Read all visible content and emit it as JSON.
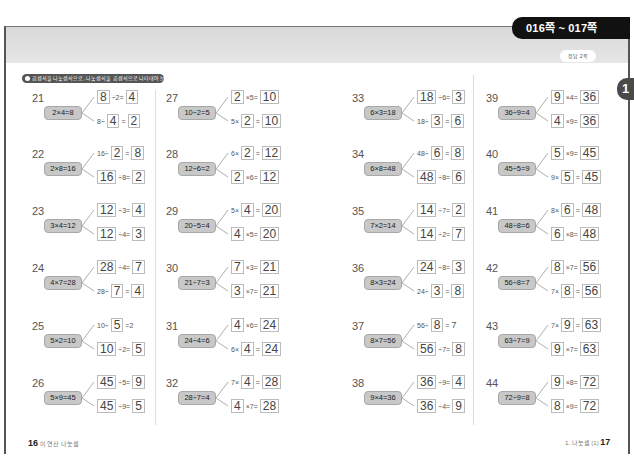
{
  "header": {
    "page_range": "016쪽 ~ 017쪽",
    "answer_label": "정답 2쪽",
    "chapter_badge": "1"
  },
  "instruction": "곱셈식을 나눗셈식으로, 나눗셈식을 곱셈식으로 나타내어 보세요.",
  "problems": [
    {
      "num": "21",
      "given": "2×4=8",
      "top": [
        [
          "box",
          "8"
        ],
        [
          "txt",
          "÷2="
        ],
        [
          "box",
          "4"
        ]
      ],
      "bottom": [
        [
          "txt",
          "8÷"
        ],
        [
          "box",
          "4"
        ],
        [
          "txt",
          "="
        ],
        [
          "box",
          "2"
        ]
      ]
    },
    {
      "num": "22",
      "given": "2×8=16",
      "top": [
        [
          "txt",
          "16÷"
        ],
        [
          "box",
          "2"
        ],
        [
          "txt",
          "="
        ],
        [
          "box",
          "8"
        ]
      ],
      "bottom": [
        [
          "box",
          "16"
        ],
        [
          "txt",
          "÷8="
        ],
        [
          "box",
          "2"
        ]
      ]
    },
    {
      "num": "23",
      "given": "3×4=12",
      "top": [
        [
          "box",
          "12"
        ],
        [
          "txt",
          "÷3="
        ],
        [
          "box",
          "4"
        ]
      ],
      "bottom": [
        [
          "box",
          "12"
        ],
        [
          "txt",
          "÷4="
        ],
        [
          "box",
          "3"
        ]
      ]
    },
    {
      "num": "24",
      "given": "4×7=28",
      "top": [
        [
          "box",
          "28"
        ],
        [
          "txt",
          "÷4="
        ],
        [
          "box",
          "7"
        ]
      ],
      "bottom": [
        [
          "txt",
          "28÷"
        ],
        [
          "box",
          "7"
        ],
        [
          "txt",
          "="
        ],
        [
          "box",
          "4"
        ]
      ]
    },
    {
      "num": "25",
      "given": "5×2=10",
      "top": [
        [
          "txt",
          "10÷"
        ],
        [
          "box",
          "5"
        ],
        [
          "txt",
          "=2"
        ]
      ],
      "bottom": [
        [
          "box",
          "10"
        ],
        [
          "txt",
          "÷2="
        ],
        [
          "box",
          "5"
        ]
      ]
    },
    {
      "num": "26",
      "given": "5×9=45",
      "top": [
        [
          "box",
          "45"
        ],
        [
          "txt",
          "÷5="
        ],
        [
          "box",
          "9"
        ]
      ],
      "bottom": [
        [
          "box",
          "45"
        ],
        [
          "txt",
          "÷9="
        ],
        [
          "box",
          "5"
        ]
      ]
    },
    {
      "num": "27",
      "given": "10÷2=5",
      "top": [
        [
          "box",
          "2"
        ],
        [
          "txt",
          "×5="
        ],
        [
          "box",
          "10"
        ]
      ],
      "bottom": [
        [
          "txt",
          "5×"
        ],
        [
          "box",
          "2"
        ],
        [
          "txt",
          "="
        ],
        [
          "box",
          "10"
        ]
      ]
    },
    {
      "num": "28",
      "given": "12÷6=2",
      "top": [
        [
          "txt",
          "6×"
        ],
        [
          "box",
          "2"
        ],
        [
          "txt",
          "="
        ],
        [
          "box",
          "12"
        ]
      ],
      "bottom": [
        [
          "box",
          "2"
        ],
        [
          "txt",
          "×6="
        ],
        [
          "box",
          "12"
        ]
      ]
    },
    {
      "num": "29",
      "given": "20÷5=4",
      "top": [
        [
          "txt",
          "5×"
        ],
        [
          "box",
          "4"
        ],
        [
          "txt",
          "="
        ],
        [
          "box",
          "20"
        ]
      ],
      "bottom": [
        [
          "box",
          "4"
        ],
        [
          "txt",
          "×5="
        ],
        [
          "box",
          "20"
        ]
      ]
    },
    {
      "num": "30",
      "given": "21÷7=3",
      "top": [
        [
          "box",
          "7"
        ],
        [
          "txt",
          "×3="
        ],
        [
          "box",
          "21"
        ]
      ],
      "bottom": [
        [
          "box",
          "3"
        ],
        [
          "txt",
          "×7="
        ],
        [
          "box",
          "21"
        ]
      ]
    },
    {
      "num": "31",
      "given": "24÷4=6",
      "top": [
        [
          "box",
          "4"
        ],
        [
          "txt",
          "×6="
        ],
        [
          "box",
          "24"
        ]
      ],
      "bottom": [
        [
          "txt",
          "6×"
        ],
        [
          "box",
          "4"
        ],
        [
          "txt",
          "="
        ],
        [
          "box",
          "24"
        ]
      ]
    },
    {
      "num": "32",
      "given": "28÷7=4",
      "top": [
        [
          "txt",
          "7×"
        ],
        [
          "box",
          "4"
        ],
        [
          "txt",
          "="
        ],
        [
          "box",
          "28"
        ]
      ],
      "bottom": [
        [
          "box",
          "4"
        ],
        [
          "txt",
          "×7="
        ],
        [
          "box",
          "28"
        ]
      ]
    },
    {
      "num": "33",
      "given": "6×3=18",
      "top": [
        [
          "box",
          "18"
        ],
        [
          "txt",
          "÷6="
        ],
        [
          "box",
          "3"
        ]
      ],
      "bottom": [
        [
          "txt",
          "18÷"
        ],
        [
          "box",
          "3"
        ],
        [
          "txt",
          "="
        ],
        [
          "box",
          "6"
        ]
      ]
    },
    {
      "num": "34",
      "given": "6×8=48",
      "top": [
        [
          "txt",
          "48÷"
        ],
        [
          "box",
          "6"
        ],
        [
          "txt",
          "="
        ],
        [
          "box",
          "8"
        ]
      ],
      "bottom": [
        [
          "box",
          "48"
        ],
        [
          "txt",
          "÷8="
        ],
        [
          "box",
          "6"
        ]
      ]
    },
    {
      "num": "35",
      "given": "7×2=14",
      "top": [
        [
          "box",
          "14"
        ],
        [
          "txt",
          "÷7="
        ],
        [
          "box",
          "2"
        ]
      ],
      "bottom": [
        [
          "box",
          "14"
        ],
        [
          "txt",
          "÷2="
        ],
        [
          "box",
          "7"
        ]
      ]
    },
    {
      "num": "36",
      "given": "8×3=24",
      "top": [
        [
          "box",
          "24"
        ],
        [
          "txt",
          "÷8="
        ],
        [
          "box",
          "3"
        ]
      ],
      "bottom": [
        [
          "txt",
          "24÷"
        ],
        [
          "box",
          "3"
        ],
        [
          "txt",
          "="
        ],
        [
          "box",
          "8"
        ]
      ]
    },
    {
      "num": "37",
      "given": "8×7=56",
      "top": [
        [
          "txt",
          "56÷"
        ],
        [
          "box",
          "8"
        ],
        [
          "txt",
          "="
        ],
        [
          "bigtxt",
          "7"
        ]
      ],
      "bottom": [
        [
          "box",
          "56"
        ],
        [
          "txt",
          "÷7="
        ],
        [
          "box",
          "8"
        ]
      ]
    },
    {
      "num": "38",
      "given": "9×4=36",
      "top": [
        [
          "box",
          "36"
        ],
        [
          "txt",
          "÷9="
        ],
        [
          "box",
          "4"
        ]
      ],
      "bottom": [
        [
          "box",
          "36"
        ],
        [
          "txt",
          "÷4="
        ],
        [
          "box",
          "9"
        ]
      ]
    },
    {
      "num": "39",
      "given": "36÷9=4",
      "top": [
        [
          "box",
          "9"
        ],
        [
          "txt",
          "×4="
        ],
        [
          "box",
          "36"
        ]
      ],
      "bottom": [
        [
          "box",
          "4"
        ],
        [
          "txt",
          "×9="
        ],
        [
          "box",
          "36"
        ]
      ]
    },
    {
      "num": "40",
      "given": "45÷5=9",
      "top": [
        [
          "box",
          "5"
        ],
        [
          "txt",
          "×9="
        ],
        [
          "box",
          "45"
        ]
      ],
      "bottom": [
        [
          "txt",
          "9×"
        ],
        [
          "box",
          "5"
        ],
        [
          "txt",
          "="
        ],
        [
          "box",
          "45"
        ]
      ]
    },
    {
      "num": "41",
      "given": "48÷8=6",
      "top": [
        [
          "txt",
          "8×"
        ],
        [
          "box",
          "6"
        ],
        [
          "txt",
          "="
        ],
        [
          "box",
          "48"
        ]
      ],
      "bottom": [
        [
          "box",
          "6"
        ],
        [
          "txt",
          "×8="
        ],
        [
          "box",
          "48"
        ]
      ]
    },
    {
      "num": "42",
      "given": "56÷8=7",
      "top": [
        [
          "box",
          "8"
        ],
        [
          "txt",
          "×7="
        ],
        [
          "box",
          "56"
        ]
      ],
      "bottom": [
        [
          "txt",
          "7×"
        ],
        [
          "box",
          "8"
        ],
        [
          "txt",
          "="
        ],
        [
          "box",
          "56"
        ]
      ]
    },
    {
      "num": "43",
      "given": "63÷7=9",
      "top": [
        [
          "txt",
          "7×"
        ],
        [
          "box",
          "9"
        ],
        [
          "txt",
          "="
        ],
        [
          "box",
          "63"
        ]
      ],
      "bottom": [
        [
          "box",
          "9"
        ],
        [
          "txt",
          "×7="
        ],
        [
          "box",
          "63"
        ]
      ]
    },
    {
      "num": "44",
      "given": "72÷9=8",
      "top": [
        [
          "box",
          "9"
        ],
        [
          "txt",
          "×8="
        ],
        [
          "box",
          "72"
        ]
      ],
      "bottom": [
        [
          "box",
          "8"
        ],
        [
          "txt",
          "×9="
        ],
        [
          "box",
          "72"
        ]
      ]
    }
  ],
  "footer": {
    "left_page": "16",
    "left_title": "이 연산 나눗셈",
    "right_title": "1. 나눗셈 (1)",
    "right_page": "17"
  }
}
